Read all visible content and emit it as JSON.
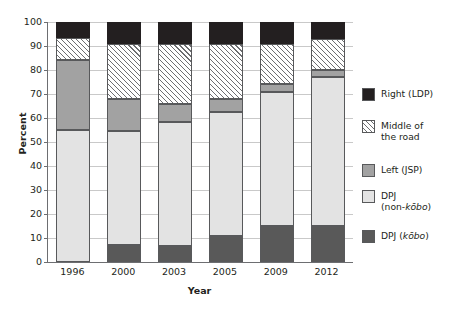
{
  "chart_data": {
    "type": "bar",
    "subtype": "stacked-bar-100",
    "title": "",
    "xlabel": "Year",
    "ylabel": "Percent",
    "categories": [
      "1996",
      "2000",
      "2003",
      "2005",
      "2009",
      "2012"
    ],
    "ylim": [
      0,
      100
    ],
    "yticks": [
      0,
      10,
      20,
      30,
      40,
      50,
      60,
      70,
      80,
      90,
      100
    ],
    "grid": true,
    "legend_position": "right",
    "stack_order_bottom_to_top": [
      "DPJ (kōbo)",
      "DPJ (non-kōbo)",
      "Left (JSP)",
      "Middle of the road",
      "Right (LDP)"
    ],
    "series": [
      {
        "name": "DPJ (kōbo)",
        "values": [
          0,
          7,
          6.5,
          11,
          15,
          15
        ]
      },
      {
        "name": "DPJ (non-kōbo)",
        "values": [
          55,
          47.5,
          52,
          51.5,
          56,
          62
        ]
      },
      {
        "name": "Left (JSP)",
        "values": [
          29,
          13.5,
          7.5,
          5.5,
          3,
          3
        ]
      },
      {
        "name": "Middle of the road",
        "values": [
          9.5,
          23,
          25,
          23,
          17,
          13
        ]
      },
      {
        "name": "Right (LDP)",
        "values": [
          6.5,
          9,
          9,
          9,
          9,
          7
        ]
      }
    ],
    "cumulative_tops": [
      [
        0,
        55,
        84,
        93.5,
        100
      ],
      [
        7,
        54.5,
        68,
        91,
        100
      ],
      [
        6.5,
        58.5,
        66,
        91,
        100
      ],
      [
        11,
        62.5,
        68,
        91,
        100
      ],
      [
        15,
        71,
        74,
        91,
        100
      ],
      [
        15,
        77,
        80,
        93,
        100
      ]
    ]
  },
  "axes": {
    "y_title": "Percent",
    "x_title": "Year",
    "y_tick_labels": [
      "100",
      "90",
      "80",
      "70",
      "60",
      "50",
      "40",
      "30",
      "20",
      "10",
      "0"
    ],
    "x_tick_labels": [
      "1996",
      "2000",
      "2003",
      "2005",
      "2009",
      "2012"
    ]
  },
  "legend": {
    "items": [
      {
        "label": "Right (LDP)",
        "swatch": "solid-black",
        "color": "#231f20"
      },
      {
        "label": "Middle of\nthe road",
        "swatch": "diagonal-hatch",
        "color": "#ffffff"
      },
      {
        "label": "Left (JSP)",
        "swatch": "solid-gray",
        "color": "#a2a2a2"
      },
      {
        "label": "DPJ\n(non-kōbo)",
        "swatch": "solid-light-gray",
        "color": "#e3e3e3"
      },
      {
        "label": "DPJ (kōbo)",
        "swatch": "solid-dark-gray",
        "color": "#595959"
      }
    ]
  },
  "colors": {
    "right_ldp": "#231f20",
    "middle_of_the_road": "#ffffff",
    "left_jsp": "#a2a2a2",
    "dpj_non_kobo": "#e3e3e3",
    "dpj_kobo": "#595959",
    "gridline": "#c9c9c9",
    "axis": "#6d6e71",
    "text": "#231f20"
  }
}
